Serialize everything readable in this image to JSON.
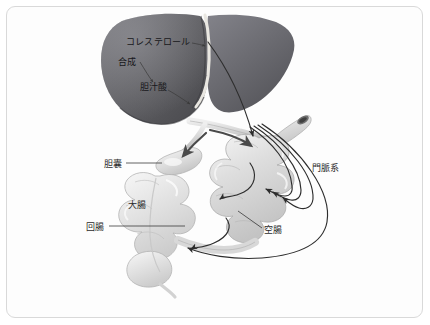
{
  "figure": {
    "background_color": "#ffffff",
    "frame_color": "#d9d9d9",
    "label_color": "#2b2b2b"
  },
  "organs": {
    "liver": {
      "name": "liver",
      "fill_dark": "#4e4e52",
      "fill_mid": "#6e6e72",
      "fill_light": "#8a8a8e",
      "ligament_color": "#e8e6e0"
    },
    "gallbladder": {
      "name": "gallbladder",
      "fill": "#d7d7d7",
      "highlight": "#f4f4f4"
    },
    "small_intestine": {
      "name": "jejunum-coils",
      "fill": "#dcdcdc",
      "highlight": "#f2f2f2",
      "outline": "#a9a9a9"
    },
    "large_intestine": {
      "name": "colon",
      "fill": "#e2e2e2",
      "highlight": "#f6f6f6",
      "outline": "#b0b0b0"
    },
    "bile_duct": {
      "name": "common-bile-duct",
      "fill": "#cfcfcf"
    }
  },
  "labels": [
    {
      "id": "cholesterol",
      "text": "コレステロール",
      "reading": "koresuterooru",
      "meaning": "cholesterol",
      "x": 126,
      "y": 45
    },
    {
      "id": "synthesis",
      "text": "合成",
      "reading": "gosei",
      "meaning": "synthesis",
      "x": 118,
      "y": 63
    },
    {
      "id": "bile-acid",
      "text": "胆汁酸",
      "reading": "tanjuusan",
      "meaning": "bile acid",
      "x": 140,
      "y": 88
    },
    {
      "id": "gallbladder",
      "text": "胆囊",
      "reading": "tannou",
      "meaning": "gallbladder",
      "x": 105,
      "y": 166
    },
    {
      "id": "large-intestine",
      "text": "大腸",
      "reading": "daichou",
      "meaning": "large intestine",
      "x": 129,
      "y": 205
    },
    {
      "id": "ileum",
      "text": "回腸",
      "reading": "kaichou",
      "meaning": "ileum",
      "x": 88,
      "y": 229
    },
    {
      "id": "jejunum",
      "text": "空腸",
      "reading": "kuuchou",
      "meaning": "jejunum",
      "x": 265,
      "y": 231
    },
    {
      "id": "portal-system",
      "text": "門脈系",
      "reading": "monmyakukei",
      "meaning": "portal venous system",
      "x": 313,
      "y": 168
    }
  ],
  "flow_arrows": [
    {
      "id": "synthesis-arrow",
      "from": "合成",
      "to": "胆汁酸",
      "kind": "thin-pointer"
    },
    {
      "id": "cholesterol-pointer",
      "from": "コレステロール",
      "to": "liver-ligament",
      "kind": "thin-pointer"
    },
    {
      "id": "bile-acid-pointer",
      "from": "胆汁酸",
      "to": "liver-lower-edge",
      "kind": "thin-pointer"
    },
    {
      "id": "duct-to-gallbladder",
      "from": "common-bile-duct",
      "to": "gallbladder",
      "kind": "bile-flow"
    },
    {
      "id": "duct-to-duodenum",
      "from": "common-bile-duct",
      "to": "duodenum",
      "kind": "bile-flow"
    },
    {
      "id": "liver-to-duodenum",
      "from": "liver",
      "to": "duodenum",
      "kind": "long-flow"
    },
    {
      "id": "jejunum-transit-upper",
      "from": "duodenum",
      "to": "jejunum",
      "kind": "transit"
    },
    {
      "id": "ileum-transit-lower",
      "from": "jejunum",
      "to": "ileum",
      "kind": "transit"
    },
    {
      "id": "portal-return-1",
      "from": "jejunum",
      "to": "liver",
      "kind": "portal"
    },
    {
      "id": "portal-return-2",
      "from": "jejunum",
      "to": "liver",
      "kind": "portal"
    },
    {
      "id": "portal-return-3",
      "from": "ileum",
      "to": "liver",
      "kind": "portal"
    },
    {
      "id": "portal-return-4",
      "from": "ileum",
      "to": "liver",
      "kind": "portal"
    }
  ],
  "leader_lines": [
    {
      "id": "gallbladder-leader",
      "label": "胆囊"
    },
    {
      "id": "ileum-leader",
      "label": "回腸"
    },
    {
      "id": "jejunum-leader",
      "label": "空腸"
    }
  ]
}
